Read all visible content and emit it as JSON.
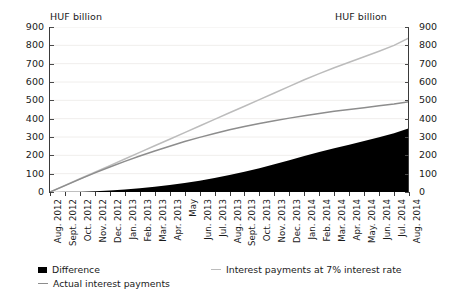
{
  "axis_unit_left": "HUF billion",
  "axis_unit_right": "HUF billion",
  "y_ticks": [
    "0",
    "100",
    "200",
    "300",
    "400",
    "500",
    "600",
    "700",
    "800",
    "900"
  ],
  "legend": {
    "difference": "Difference",
    "seven_percent": "Interest payments at 7% interest rate",
    "actual": "Actual interest payments"
  },
  "colors": {
    "difference": "#000000",
    "actual": "#8d8d8d",
    "seven_percent": "#bcbcbc",
    "axis": "#3a3a3a",
    "grid": "#f0eeec",
    "background": "#ffffff"
  },
  "chart_data": {
    "type": "area",
    "title": "",
    "xlabel": "",
    "ylabel": "HUF billion",
    "ylim": [
      0,
      900
    ],
    "grid": true,
    "legend_position": "bottom-left",
    "categories": [
      "Aug. 2012",
      "Sept. 2012",
      "Oct. 2012",
      "Nov. 2012",
      "Dec. 2012",
      "Jan. 2013",
      "Feb. 2013",
      "Mar. 2013",
      "Apr. 2013",
      "May",
      "Jun. 2013",
      "Jul. 2013",
      "Aug. 2013",
      "Sept. 2013",
      "Oct. 2013",
      "Nov. 2013",
      "Dec. 2013",
      "Jan. 2014",
      "Feb. 2014",
      "Mar. 2014",
      "Apr. 2014",
      "May. 2014",
      "Jun. 2014",
      "Jul. 2014",
      "Aug. 2014"
    ],
    "series": [
      {
        "name": "Interest payments at 7% interest rate",
        "type": "line",
        "color": "#bcbcbc",
        "values": [
          0,
          36,
          72,
          108,
          144,
          180,
          216,
          252,
          288,
          324,
          360,
          396,
          432,
          468,
          504,
          540,
          576,
          612,
          646,
          678,
          708,
          738,
          768,
          800,
          840
        ]
      },
      {
        "name": "Actual interest payments",
        "type": "line",
        "color": "#8d8d8d",
        "values": [
          0,
          35,
          70,
          104,
          136,
          167,
          196,
          224,
          250,
          275,
          298,
          319,
          339,
          357,
          374,
          389,
          403,
          416,
          428,
          440,
          450,
          460,
          470,
          480,
          492
        ]
      },
      {
        "name": "Difference",
        "type": "area",
        "color": "#000000",
        "values": [
          0,
          1,
          2,
          4,
          8,
          13,
          20,
          28,
          38,
          49,
          62,
          77,
          93,
          111,
          130,
          151,
          173,
          196,
          218,
          238,
          258,
          278,
          298,
          320,
          348
        ]
      }
    ]
  }
}
